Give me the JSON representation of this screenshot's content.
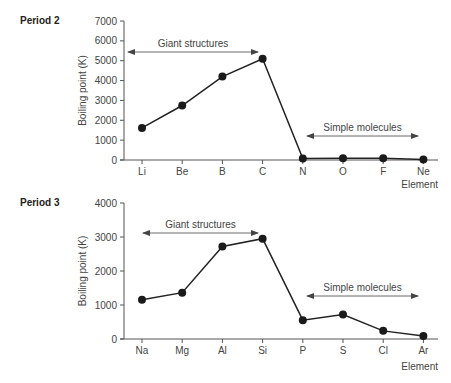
{
  "chart_data": [
    {
      "type": "line",
      "title": "Period 2",
      "xlabel": "Element",
      "ylabel": "Boiling point (K)",
      "categories": [
        "Li",
        "Be",
        "B",
        "C",
        "N",
        "O",
        "F",
        "Ne"
      ],
      "values": [
        1615,
        2745,
        4200,
        5100,
        77,
        90,
        85,
        27
      ],
      "ylim": [
        0,
        7000
      ],
      "yticks": [
        0,
        1000,
        2000,
        3000,
        4000,
        5000,
        6000,
        7000
      ],
      "grid": false,
      "annotations": [
        {
          "text": "Giant structures",
          "from": "Li",
          "to": "C",
          "type": "double-arrow"
        },
        {
          "text": "Simple molecules",
          "from": "N",
          "to": "Ne",
          "type": "double-arrow"
        }
      ]
    },
    {
      "type": "line",
      "title": "Period 3",
      "xlabel": "Element",
      "ylabel": "Boiling point (K)",
      "categories": [
        "Na",
        "Mg",
        "Al",
        "Si",
        "P",
        "S",
        "Cl",
        "Ar"
      ],
      "values": [
        1156,
        1363,
        2720,
        2950,
        553,
        718,
        239,
        87
      ],
      "ylim": [
        0,
        4000
      ],
      "yticks": [
        0,
        1000,
        2000,
        3000,
        4000
      ],
      "grid": false,
      "annotations": [
        {
          "text": "Giant structures",
          "from": "Na",
          "to": "Si",
          "type": "double-arrow"
        },
        {
          "text": "Simple molecules",
          "from": "P",
          "to": "Ar",
          "type": "double-arrow"
        }
      ]
    }
  ],
  "style": {
    "line_color": "#222222",
    "marker_color": "#1a1a1a",
    "axis_color": "#555555"
  }
}
